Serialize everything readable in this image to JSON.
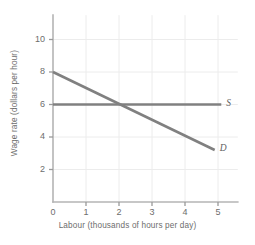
{
  "chart_data": {
    "type": "line",
    "title": "",
    "xlabel": "Labour (thousands of hours per day)",
    "ylabel": "Wage rate (dollars per hour)",
    "xlim": [
      0,
      5.6
    ],
    "ylim": [
      0,
      11.5
    ],
    "xticks": [
      "0",
      "1",
      "2",
      "3",
      "4",
      "5"
    ],
    "xtick_values": [
      0,
      1,
      2,
      3,
      4,
      5
    ],
    "yticks": [
      "2",
      "4",
      "6",
      "8",
      "10"
    ],
    "ytick_values": [
      2,
      4,
      6,
      8,
      10
    ],
    "grid": true,
    "legend": "inline-curve-labels",
    "series": [
      {
        "name": "S",
        "label": "S",
        "description": "Supply of labour (perfectly elastic at wage 6)",
        "x": [
          0,
          5.1
        ],
        "values": [
          6,
          6
        ],
        "color": "#808080"
      },
      {
        "name": "D",
        "label": "D",
        "description": "Demand for labour (downward sloping)",
        "x": [
          0,
          4.9
        ],
        "values": [
          8,
          3.2
        ],
        "color": "#808080"
      }
    ],
    "equilibrium": {
      "labour": 2,
      "wage": 6
    }
  },
  "axes": {
    "x_axis_name": "labour-axis",
    "y_axis_name": "wage-axis",
    "axis_color": "#b4b4b4",
    "grid_color": "#ececec",
    "tick_color": "#9a9a9a"
  },
  "curve_labels": {
    "supply": "S",
    "demand": "D"
  }
}
